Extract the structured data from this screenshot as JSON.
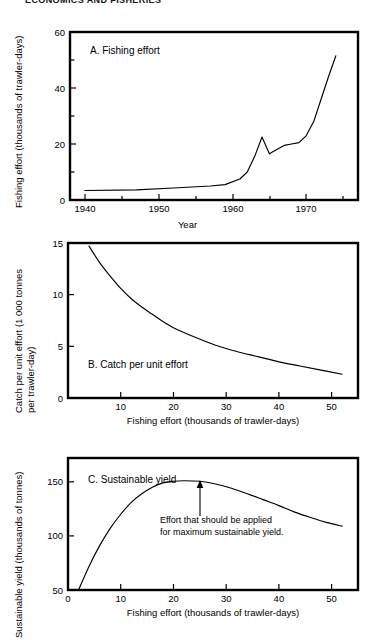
{
  "header": {
    "text": "ECONOMICS AND FISHERIES"
  },
  "figure": {
    "shared_xlabel": "Fishing effort (thousands of trawler-days)"
  },
  "chart_data": [
    {
      "id": "A",
      "type": "line",
      "title": "A. Fishing effort",
      "xlabel": "Year",
      "ylabel": "Fishing effort (thousands of trawler-days)",
      "xlim": [
        1938,
        1977
      ],
      "ylim": [
        0,
        60
      ],
      "xticks": [
        1940,
        1950,
        1960,
        1970
      ],
      "xtick_labels": [
        "1940",
        "1950",
        "1960",
        "1970"
      ],
      "xminor": [
        1945,
        1955,
        1965,
        1975
      ],
      "yticks": [
        0,
        20,
        40,
        60
      ],
      "ytick_labels": [
        "0",
        "20",
        "40",
        "60"
      ],
      "yminor": [
        10,
        30,
        50
      ],
      "grid": false,
      "legend": "none",
      "x": [
        1940,
        1947,
        1952,
        1957,
        1959,
        1961,
        1962,
        1963,
        1964,
        1965,
        1966,
        1967,
        1968,
        1969,
        1970,
        1971,
        1972,
        1973,
        1974
      ],
      "values": [
        3.4,
        3.6,
        4.3,
        5.0,
        5.5,
        7.5,
        10.0,
        15.5,
        22.5,
        16.5,
        18.0,
        19.5,
        20.0,
        20.5,
        23.0,
        28.0,
        36.0,
        44.0,
        51.5
      ]
    },
    {
      "id": "B",
      "type": "line",
      "title": "B. Catch per unit effort",
      "xlabel": "Fishing effort (thousands of trawler-days)",
      "ylabel": "Catch per unit effort (1 000 tonnes per trawler-day)",
      "ylabel_line1": "Catch per unit effort (1 000 tonnes",
      "ylabel_line2": "per trawler-day)",
      "xlim": [
        0,
        55
      ],
      "ylim": [
        0,
        15
      ],
      "xticks": [
        10,
        20,
        30,
        40,
        50
      ],
      "xtick_labels": [
        "10",
        "20",
        "30",
        "40",
        "50"
      ],
      "yticks": [
        0,
        5,
        10,
        15
      ],
      "ytick_labels": [
        "0",
        "5",
        "10",
        "15"
      ],
      "grid": false,
      "legend": "none",
      "x": [
        4,
        6,
        8,
        10,
        12,
        14,
        16,
        18,
        20,
        24,
        28,
        32,
        36,
        40,
        44,
        48,
        52
      ],
      "values": [
        14.7,
        13.1,
        11.8,
        10.6,
        9.6,
        8.8,
        8.1,
        7.4,
        6.8,
        5.9,
        5.1,
        4.5,
        4.0,
        3.5,
        3.1,
        2.7,
        2.3
      ]
    },
    {
      "id": "C",
      "type": "line",
      "title": "C. Sustainable yield",
      "xlabel": "Fishing effort (thousands of trawler-days)",
      "ylabel": "Sustainable yield (thousands of tonnes)",
      "xlim": [
        0,
        55
      ],
      "ylim": [
        50,
        172
      ],
      "xticks": [
        0,
        10,
        20,
        30,
        40,
        50
      ],
      "xtick_labels": [
        "0",
        "10",
        "20",
        "30",
        "40",
        "50"
      ],
      "yticks": [
        50,
        100,
        150
      ],
      "ytick_labels": [
        "50",
        "100",
        "150"
      ],
      "grid": false,
      "legend": "none",
      "annotation": {
        "line1": "Effort that should be applied",
        "line2": "for maximum sustainable yield.",
        "arrow_points_to_x": 25,
        "arrow_points_to_y": 150
      },
      "x": [
        2,
        4,
        6,
        8,
        10,
        12,
        14,
        16,
        18,
        20,
        22,
        25,
        28,
        31,
        34,
        37,
        40,
        43,
        46,
        49,
        52
      ],
      "values": [
        50,
        72,
        91,
        107,
        120,
        131,
        139,
        145,
        149,
        150.5,
        151,
        150.5,
        148,
        144,
        139,
        133.5,
        128,
        122,
        117,
        112.5,
        109
      ]
    }
  ]
}
